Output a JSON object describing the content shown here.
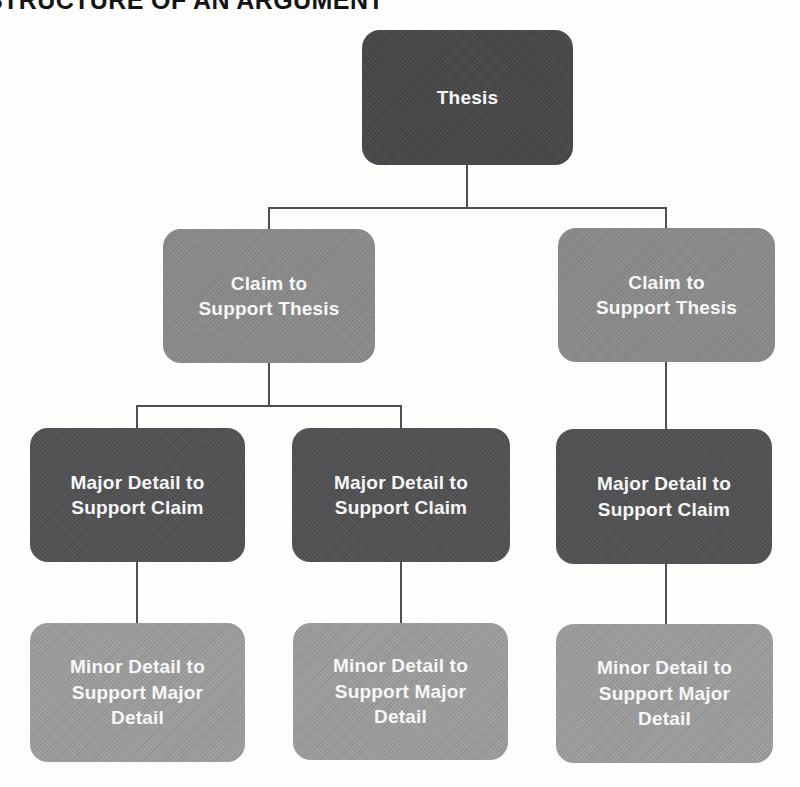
{
  "title": "STRUCTURE OF AN ARGUMENT",
  "colors": {
    "background": "#fdfdfc",
    "title_color": "#141414",
    "thesis_fill": "#48484a",
    "claim_fill": "#8b8b8b",
    "major_fill": "#525254",
    "minor_fill": "#9d9d9d",
    "text": "#f7f7f7",
    "connector": "#4f4f4f"
  },
  "diagram": {
    "nodes": [
      {
        "id": "thesis",
        "level": "thesis",
        "label": "Thesis",
        "lines": [
          "Thesis"
        ]
      },
      {
        "id": "claim-left",
        "level": "claim",
        "label": "Claim to Support Thesis",
        "lines": [
          "Claim to",
          "Support Thesis"
        ]
      },
      {
        "id": "claim-right",
        "level": "claim",
        "label": "Claim to Support Thesis",
        "lines": [
          "Claim to",
          "Support Thesis"
        ]
      },
      {
        "id": "major-left",
        "level": "major",
        "label": "Major Detail to Support Claim",
        "lines": [
          "Major Detail to",
          "Support Claim"
        ]
      },
      {
        "id": "major-middle",
        "level": "major",
        "label": "Major Detail to Support Claim",
        "lines": [
          "Major Detail to",
          "Support Claim"
        ]
      },
      {
        "id": "major-right",
        "level": "major",
        "label": "Major Detail to Support Claim",
        "lines": [
          "Major Detail to",
          "Support Claim"
        ]
      },
      {
        "id": "minor-left",
        "level": "minor",
        "label": "Minor Detail to Support Major Detail",
        "lines": [
          "Minor Detail to",
          "Support Major",
          "Detail"
        ]
      },
      {
        "id": "minor-middle",
        "level": "minor",
        "label": "Minor Detail to Support Major Detail",
        "lines": [
          "Minor Detail to",
          "Support Major",
          "Detail"
        ]
      },
      {
        "id": "minor-right",
        "level": "minor",
        "label": "Minor Detail to Support Major Detail",
        "lines": [
          "Minor Detail to",
          "Support Major",
          "Detail"
        ]
      }
    ],
    "edges": [
      {
        "from": "thesis",
        "to": "claim-left"
      },
      {
        "from": "thesis",
        "to": "claim-right"
      },
      {
        "from": "claim-left",
        "to": "major-left"
      },
      {
        "from": "claim-left",
        "to": "major-middle"
      },
      {
        "from": "claim-right",
        "to": "major-right"
      },
      {
        "from": "major-left",
        "to": "minor-left"
      },
      {
        "from": "major-middle",
        "to": "minor-middle"
      },
      {
        "from": "major-right",
        "to": "minor-right"
      }
    ]
  }
}
